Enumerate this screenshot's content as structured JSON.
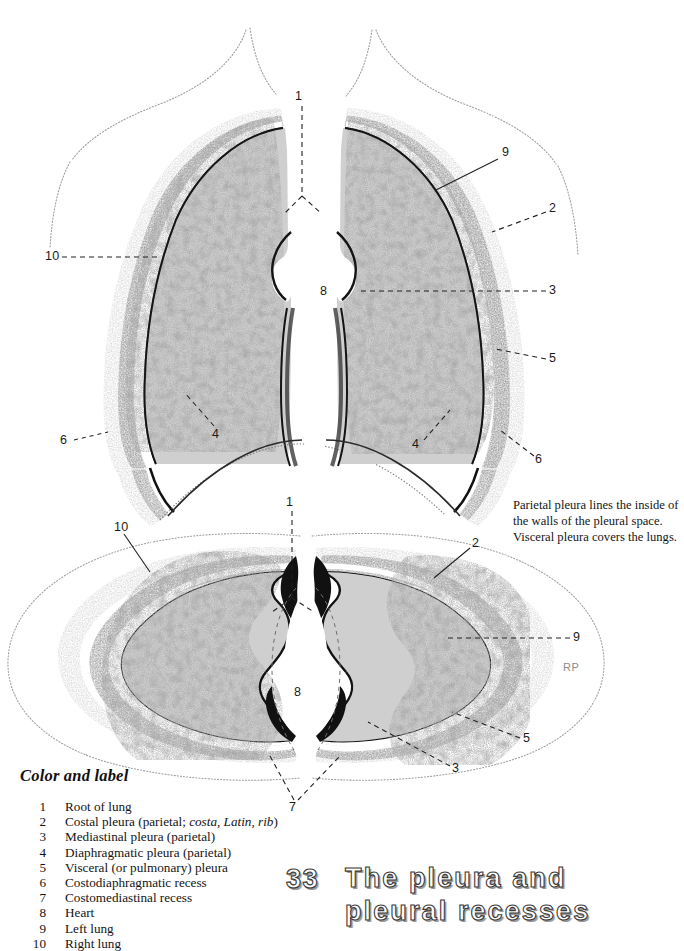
{
  "page": {
    "background_color": "#ffffff",
    "ink_color": "#1a1a1a"
  },
  "chapter": {
    "number": "33",
    "title": "The pleura and\npleural recesses"
  },
  "note": {
    "text": "Parietal pleura lines the inside of the walls of the pleural space.  Visceral pleura covers the lungs."
  },
  "legend": {
    "heading": "Color and label",
    "items": [
      {
        "number": "1",
        "text_before": "Root of lung",
        "italic": "",
        "text_after": ""
      },
      {
        "number": "2",
        "text_before": "Costal pleura (parietal; ",
        "italic": "costa, Latin, rib",
        "text_after": ")"
      },
      {
        "number": "3",
        "text_before": "Mediastinal pleura (parietal)",
        "italic": "",
        "text_after": ""
      },
      {
        "number": "4",
        "text_before": "Diaphragmatic pleura (parietal)",
        "italic": "",
        "text_after": ""
      },
      {
        "number": "5",
        "text_before": "Visceral (or pulmonary) pleura",
        "italic": "",
        "text_after": ""
      },
      {
        "number": "6",
        "text_before": "Costodiaphragmatic recess",
        "italic": "",
        "text_after": ""
      },
      {
        "number": "7",
        "text_before": "Costomediastinal recess",
        "italic": "",
        "text_after": ""
      },
      {
        "number": "8",
        "text_before": "Heart",
        "italic": "",
        "text_after": ""
      },
      {
        "number": "9",
        "text_before": "Left lung",
        "italic": "",
        "text_after": ""
      },
      {
        "number": "10",
        "text_before": "Right lung",
        "italic": "",
        "text_after": ""
      }
    ]
  },
  "watermark": {
    "text": "RP"
  },
  "figures": [
    {
      "name": "coronal-thorax-section",
      "callouts": [
        {
          "id": "c-1",
          "number": "1",
          "x": 299,
          "y": 96
        },
        {
          "id": "c-9",
          "number": "9",
          "x": 504,
          "y": 152
        },
        {
          "id": "c-2",
          "number": "2",
          "x": 551,
          "y": 208
        },
        {
          "id": "c-3",
          "number": "3",
          "x": 551,
          "y": 287
        },
        {
          "id": "c-5",
          "number": "5",
          "x": 551,
          "y": 355
        },
        {
          "id": "c-8",
          "number": "8",
          "x": 322,
          "y": 288
        },
        {
          "id": "c-10",
          "number": "10",
          "x": 52,
          "y": 253
        },
        {
          "id": "c-6l",
          "number": "6",
          "x": 62,
          "y": 437
        },
        {
          "id": "c-4l",
          "number": "4",
          "x": 214,
          "y": 434
        },
        {
          "id": "c-4r",
          "number": "4",
          "x": 414,
          "y": 445
        },
        {
          "id": "c-6r",
          "number": "6",
          "x": 537,
          "y": 460
        }
      ]
    },
    {
      "name": "transverse-thorax-section",
      "callouts": [
        {
          "id": "t-1",
          "number": "1",
          "x": 288,
          "y": 501
        },
        {
          "id": "t-10",
          "number": "10",
          "x": 120,
          "y": 525
        },
        {
          "id": "t-2",
          "number": "2",
          "x": 473,
          "y": 541
        },
        {
          "id": "t-9",
          "number": "9",
          "x": 575,
          "y": 634
        },
        {
          "id": "t-5",
          "number": "5",
          "x": 525,
          "y": 735
        },
        {
          "id": "t-3",
          "number": "3",
          "x": 454,
          "y": 765
        },
        {
          "id": "t-7",
          "number": "7",
          "x": 291,
          "y": 806
        },
        {
          "id": "t-8",
          "number": "8",
          "x": 296,
          "y": 690
        }
      ]
    }
  ]
}
